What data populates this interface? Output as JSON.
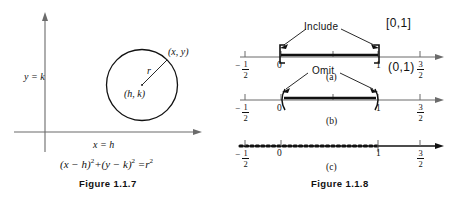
{
  "figures": [
    {
      "id": "figure-1-1-7",
      "caption": "Figure 1.1.7",
      "axis_labels": {
        "vertical": "y = k",
        "horizontal": "x = h"
      },
      "circle": {
        "center_label": "(h, k)",
        "radius_label": "r",
        "point_label": "(x, y)"
      },
      "equation": {
        "lhs_a": "(x − h)",
        "lhs_a_exp": "2",
        "plus": "+",
        "lhs_b": "(y − k)",
        "lhs_b_exp": "2",
        "equals": "=",
        "rhs": "r",
        "rhs_exp": "2",
        "full": "(x − h)² + (y − k)² = r²"
      }
    },
    {
      "id": "figure-1-1-8",
      "caption": "Figure 1.1.8",
      "panels": [
        {
          "key": "a",
          "sublabel": "(a)",
          "annotation": "Include",
          "interval_notation": "[0,1]",
          "endpoint_style": "closed-brackets",
          "tick_labels": [
            "-1/2",
            "0",
            "1",
            "3/2"
          ]
        },
        {
          "key": "b",
          "sublabel": "(b)",
          "annotation": "Omit",
          "interval_notation": "(0,1)",
          "endpoint_style": "open-parentheses",
          "tick_labels": [
            "-1/2",
            "0",
            "1",
            "3/2"
          ]
        },
        {
          "key": "c",
          "sublabel": "(c)",
          "annotation": "",
          "interval_notation": "",
          "endpoint_style": "dotted",
          "tick_labels": [
            "-1/2",
            "0",
            "1",
            "3/2"
          ]
        }
      ],
      "tick_values": {
        "neg_half_num": "1",
        "neg_half_den": "2",
        "neg_sign": "−",
        "zero": "0",
        "one": "1",
        "three_half_num": "3",
        "three_half_den": "2"
      }
    }
  ],
  "colors": {
    "ink": "#1a1a1a",
    "axis": "#555555",
    "background": "#ffffff"
  }
}
